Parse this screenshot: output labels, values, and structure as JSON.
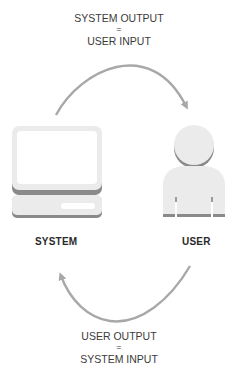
{
  "diagram": {
    "top_caption": {
      "line1": "SYSTEM OUTPUT",
      "line2": "=",
      "line3": "USER INPUT"
    },
    "bottom_caption": {
      "line1": "USER OUTPUT",
      "line2": "=",
      "line3": "SYSTEM INPUT"
    },
    "nodes": [
      {
        "id": "system",
        "label": "SYSTEM",
        "icon": "computer-icon"
      },
      {
        "id": "user",
        "label": "USER",
        "icon": "person-icon"
      }
    ],
    "edges": [
      {
        "from": "system",
        "to": "user",
        "label": "SYSTEM OUTPUT = USER INPUT"
      },
      {
        "from": "user",
        "to": "system",
        "label": "USER OUTPUT = SYSTEM INPUT"
      }
    ],
    "colors": {
      "arrow": "#a8a8a8",
      "icon_fill": "#ebebeb",
      "icon_shadow": "#8a8a8a",
      "text": "#2a2a2a"
    }
  }
}
